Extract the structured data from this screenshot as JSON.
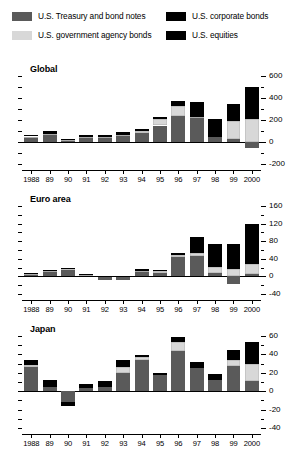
{
  "legend": {
    "items": [
      {
        "label": "U.S. Treasury and bond notes",
        "color": "#5a5a5a",
        "key": "treasury"
      },
      {
        "label": "U.S. government agency bonds",
        "color": "#d8d8d8",
        "key": "agency"
      },
      {
        "label": "U.S. corporate bonds",
        "color": "#000000",
        "key": "corporate"
      },
      {
        "label": "U.S. equities",
        "color": "#000000",
        "key": "equities"
      }
    ]
  },
  "chart_data": [
    {
      "type": "bar",
      "title": "Global",
      "stacked": true,
      "xlabel": "",
      "ylabel": "",
      "ylim": [
        -200,
        600
      ],
      "yticks": [
        -200,
        0,
        200,
        400,
        600
      ],
      "axis_position": "right",
      "grid": false,
      "categories": [
        "1988",
        "89",
        "90",
        "91",
        "92",
        "93",
        "94",
        "95",
        "96",
        "97",
        "98",
        "99",
        "2000"
      ],
      "series": [
        {
          "name": "U.S. Treasury and bond notes",
          "color": "#5a5a5a",
          "values": [
            42,
            60,
            18,
            38,
            40,
            58,
            82,
            150,
            235,
            215,
            45,
            30,
            -55
          ]
        },
        {
          "name": "U.S. government agency bonds",
          "color": "#d8d8d8",
          "values": [
            8,
            10,
            3,
            8,
            8,
            10,
            22,
            55,
            95,
            10,
            0,
            165,
            210
          ]
        },
        {
          "name": "U.S. corporate bonds",
          "color": "#000000",
          "values": [
            15,
            28,
            10,
            18,
            12,
            25,
            18,
            25,
            42,
            75,
            65,
            25,
            130
          ]
        },
        {
          "name": "U.S. equities",
          "color": "#000000",
          "values": [
            0,
            0,
            0,
            0,
            0,
            0,
            0,
            0,
            0,
            60,
            95,
            130,
            160
          ]
        }
      ],
      "notes": "Stacked bars; 2000 Treasury segment is negative."
    },
    {
      "type": "bar",
      "title": "Euro area",
      "stacked": true,
      "xlabel": "",
      "ylabel": "",
      "ylim": [
        -40,
        160
      ],
      "yticks": [
        -40,
        0,
        40,
        80,
        120,
        160
      ],
      "axis_position": "right",
      "grid": false,
      "categories": [
        "1988",
        "89",
        "90",
        "91",
        "92",
        "93",
        "94",
        "95",
        "96",
        "97",
        "98",
        "99",
        "2000"
      ],
      "series": [
        {
          "name": "U.S. Treasury and bond notes",
          "color": "#5a5a5a",
          "values": [
            4,
            12,
            14,
            3,
            -9,
            -8,
            10,
            8,
            44,
            47,
            8,
            -18,
            6
          ]
        },
        {
          "name": "U.S. government agency bonds",
          "color": "#d8d8d8",
          "values": [
            1,
            1,
            4,
            1,
            0,
            0,
            2,
            5,
            4,
            6,
            14,
            16,
            22
          ]
        },
        {
          "name": "U.S. corporate bonds",
          "color": "#000000",
          "values": [
            2,
            2,
            1,
            1,
            1,
            2,
            5,
            2,
            5,
            5,
            6,
            7,
            10
          ]
        },
        {
          "name": "U.S. equities",
          "color": "#000000",
          "values": [
            0,
            0,
            0,
            0,
            0,
            0,
            0,
            0,
            0,
            32,
            45,
            50,
            82
          ]
        }
      ],
      "notes": "1992, 1993 and 1999 Treasury segments are negative."
    },
    {
      "type": "bar",
      "title": "Japan",
      "stacked": true,
      "xlabel": "",
      "ylabel": "",
      "ylim": [
        -40,
        60
      ],
      "yticks": [
        -40,
        -20,
        0,
        20,
        40,
        60
      ],
      "axis_position": "right",
      "grid": false,
      "categories": [
        "1988",
        "89",
        "90",
        "91",
        "92",
        "93",
        "94",
        "95",
        "96",
        "97",
        "98",
        "99",
        "2000"
      ],
      "series": [
        {
          "name": "U.S. Treasury and bond notes",
          "color": "#5a5a5a",
          "values": [
            26,
            5,
            -12,
            4,
            5,
            20,
            34,
            18,
            44,
            25,
            12,
            27,
            11
          ]
        },
        {
          "name": "U.S. government agency bonds",
          "color": "#d8d8d8",
          "values": [
            3,
            0,
            0,
            0,
            0,
            6,
            3,
            0,
            9,
            0,
            0,
            7,
            19
          ]
        },
        {
          "name": "U.S. corporate bonds",
          "color": "#000000",
          "values": [
            5,
            7,
            -4,
            4,
            6,
            8,
            2,
            2,
            6,
            7,
            7,
            11,
            22
          ]
        },
        {
          "name": "U.S. equities",
          "color": "#000000",
          "values": [
            0,
            0,
            0,
            0,
            0,
            0,
            0,
            0,
            0,
            0,
            0,
            0,
            2
          ]
        }
      ],
      "notes": "1990 bar is entirely negative."
    }
  ]
}
